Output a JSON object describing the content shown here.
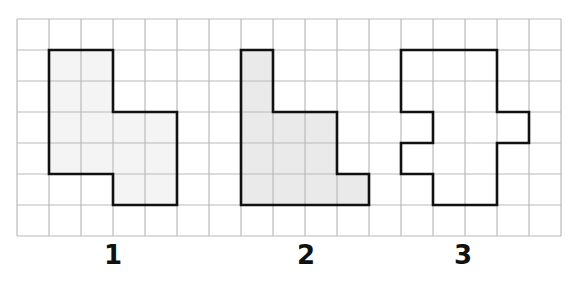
{
  "grid": {
    "columns": 17,
    "rows": 7,
    "origin_x": 17,
    "origin_y": 19,
    "cell_width": 32,
    "cell_height": 31,
    "line_color": "#b9b9b9",
    "outline_color": "#111111"
  },
  "shapes": [
    {
      "label": "1",
      "fill": "#f4f4f4",
      "label_x": 113,
      "vertices": [
        [
          1,
          1
        ],
        [
          3,
          1
        ],
        [
          3,
          3
        ],
        [
          5,
          3
        ],
        [
          5,
          6
        ],
        [
          3,
          6
        ],
        [
          3,
          5
        ],
        [
          1,
          5
        ]
      ]
    },
    {
      "label": "2",
      "fill": "#eaeaea",
      "label_x": 306,
      "vertices": [
        [
          7,
          1
        ],
        [
          8,
          1
        ],
        [
          8,
          3
        ],
        [
          10,
          3
        ],
        [
          10,
          5
        ],
        [
          11,
          5
        ],
        [
          11,
          6
        ],
        [
          7,
          6
        ]
      ]
    },
    {
      "label": "3",
      "fill": "#ffffff",
      "label_x": 463,
      "vertices": [
        [
          12,
          1
        ],
        [
          15,
          1
        ],
        [
          15,
          3
        ],
        [
          16,
          3
        ],
        [
          16,
          4
        ],
        [
          15,
          4
        ],
        [
          15,
          6
        ],
        [
          13,
          6
        ],
        [
          13,
          5
        ],
        [
          12,
          5
        ],
        [
          12,
          4
        ],
        [
          13,
          4
        ],
        [
          13,
          3
        ],
        [
          12,
          3
        ]
      ]
    }
  ]
}
